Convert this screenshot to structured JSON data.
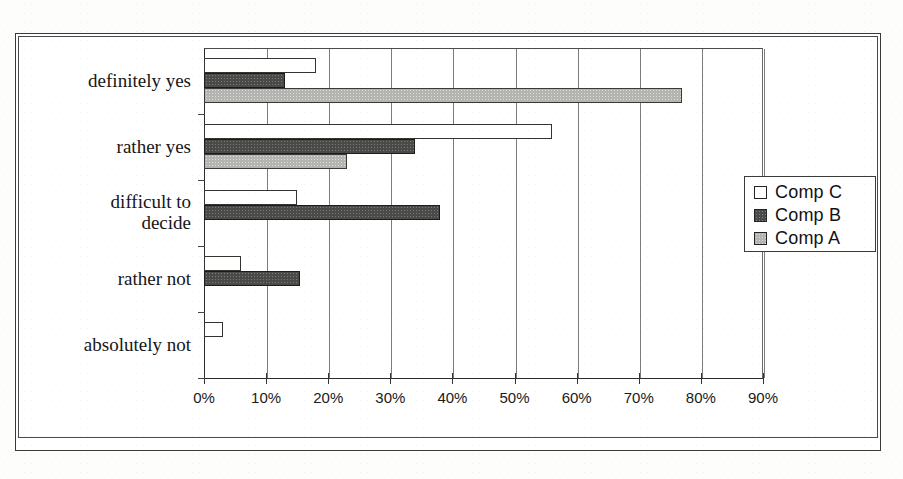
{
  "chart_data": {
    "type": "bar",
    "orientation": "horizontal",
    "title": "",
    "subtitle": "",
    "xlabel": "",
    "ylabel": "",
    "xlim": [
      0,
      90
    ],
    "xtick_labels": [
      "0%",
      "10%",
      "20%",
      "30%",
      "40%",
      "50%",
      "60%",
      "70%",
      "80%",
      "90%"
    ],
    "xticks": [
      0,
      10,
      20,
      30,
      40,
      50,
      60,
      70,
      80,
      90
    ],
    "grid": true,
    "grid_axis": "x",
    "legend_position": "right",
    "categories": [
      "definitely yes",
      "rather yes",
      "difficult to\ndecide",
      "rather not",
      "absolutely not"
    ],
    "series": [
      {
        "name": "Comp C",
        "color": "#ffffff",
        "values": [
          18,
          56,
          15,
          6,
          3
        ]
      },
      {
        "name": "Comp B",
        "color": "#4a4a48",
        "values": [
          13,
          34,
          38,
          15.5,
          0
        ]
      },
      {
        "name": "Comp A",
        "color": "#b4b4b0",
        "values": [
          77,
          23,
          0,
          0,
          0
        ]
      }
    ]
  },
  "legend": {
    "entries": [
      {
        "label": "Comp C",
        "swatch": "white-square-icon"
      },
      {
        "label": "Comp B",
        "swatch": "dark-square-icon"
      },
      {
        "label": "Comp A",
        "swatch": "grey-square-icon"
      }
    ]
  },
  "axis": {
    "x_tick_labels": [
      "0%",
      "10%",
      "20%",
      "30%",
      "40%",
      "50%",
      "60%",
      "70%",
      "80%",
      "90%"
    ]
  },
  "categories": {
    "labels": [
      "definitely yes",
      "rather yes",
      "difficult to\ndecide",
      "rather not",
      "absolutely not"
    ]
  }
}
